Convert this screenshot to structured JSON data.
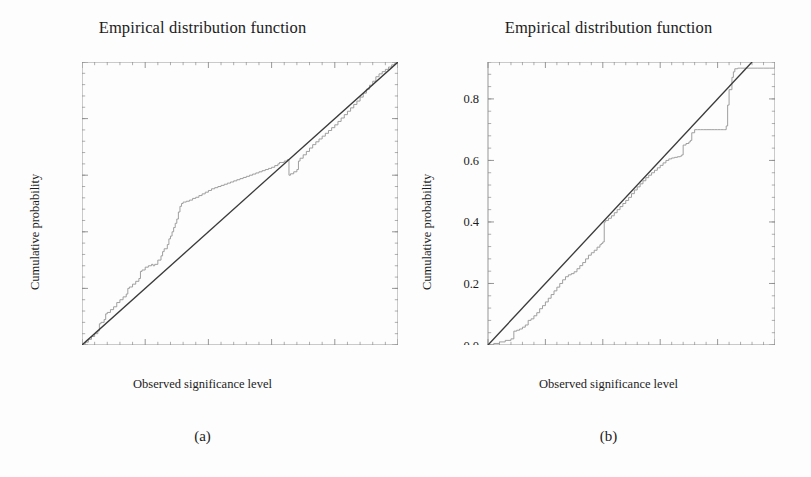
{
  "figure": {
    "caption_a": "(a)",
    "caption_b": "(b)",
    "line_color_ecdf": "#9a9a9a",
    "line_color_reference": "#3a3a3a",
    "frame_color": "#8c8c8c",
    "background": "#fdfdfd"
  },
  "panel_a": {
    "title": "Empirical distribution function",
    "xlabel": "Observed significance level",
    "ylabel": "Cumulative probability",
    "caption": "(a)",
    "xticks": [
      "0.0",
      "0.2",
      "0.4",
      "0.6",
      "0.8",
      "1.0"
    ],
    "yticks": [
      "0.0",
      "0.2",
      "0.4",
      "0.6",
      "0.8",
      "1.0"
    ]
  },
  "panel_b": {
    "title": "Empirical distribution function",
    "xlabel": "Observed significance level",
    "ylabel": "Cumulative probability",
    "caption": "(b)",
    "xticks": [
      "0.0",
      "0.2",
      "0.4",
      "0.6",
      "0.8",
      "1.0"
    ],
    "yticks": [
      "0.0",
      "0.2",
      "0.4",
      "0.6",
      "0.8"
    ]
  },
  "chart_data": [
    {
      "type": "line",
      "id": "panel-a",
      "title": "Empirical distribution function",
      "xlabel": "Observed significance level",
      "ylabel": "Cumulative probability",
      "xlim": [
        0.0,
        1.0
      ],
      "ylim": [
        0.0,
        1.0
      ],
      "xticks": [
        0.0,
        0.2,
        0.4,
        0.6,
        0.8,
        1.0
      ],
      "yticks": [
        0.0,
        0.2,
        0.4,
        0.6,
        0.8,
        1.0
      ],
      "grid": false,
      "legend": "none",
      "series": [
        {
          "name": "Empirical CDF",
          "style": "step",
          "color": "#9a9a9a",
          "x": [
            0.0,
            0.01,
            0.02,
            0.03,
            0.04,
            0.05,
            0.055,
            0.06,
            0.07,
            0.075,
            0.08,
            0.09,
            0.1,
            0.11,
            0.12,
            0.13,
            0.14,
            0.145,
            0.15,
            0.16,
            0.17,
            0.18,
            0.185,
            0.19,
            0.2,
            0.21,
            0.22,
            0.225,
            0.23,
            0.24,
            0.25,
            0.255,
            0.26,
            0.27,
            0.275,
            0.28,
            0.285,
            0.29,
            0.295,
            0.3,
            0.305,
            0.31,
            0.315,
            0.32,
            0.325,
            0.33,
            0.34,
            0.35,
            0.36,
            0.37,
            0.38,
            0.39,
            0.4,
            0.41,
            0.42,
            0.43,
            0.44,
            0.45,
            0.46,
            0.47,
            0.48,
            0.49,
            0.5,
            0.51,
            0.52,
            0.53,
            0.54,
            0.55,
            0.56,
            0.57,
            0.58,
            0.59,
            0.6,
            0.61,
            0.62,
            0.625,
            0.63,
            0.64,
            0.65,
            0.655,
            0.66,
            0.67,
            0.68,
            0.685,
            0.69,
            0.7,
            0.71,
            0.72,
            0.73,
            0.74,
            0.75,
            0.76,
            0.77,
            0.78,
            0.79,
            0.8,
            0.81,
            0.82,
            0.83,
            0.84,
            0.85,
            0.86,
            0.87,
            0.88,
            0.89,
            0.9,
            0.91,
            0.92,
            0.93,
            0.94,
            0.95,
            0.96,
            0.97,
            0.98,
            0.99,
            1.0
          ],
          "y": [
            0.0,
            0.01,
            0.02,
            0.03,
            0.04,
            0.05,
            0.075,
            0.08,
            0.09,
            0.11,
            0.115,
            0.125,
            0.135,
            0.15,
            0.16,
            0.17,
            0.18,
            0.2,
            0.205,
            0.215,
            0.225,
            0.235,
            0.26,
            0.265,
            0.275,
            0.28,
            0.285,
            0.28,
            0.285,
            0.3,
            0.315,
            0.33,
            0.34,
            0.355,
            0.375,
            0.385,
            0.4,
            0.415,
            0.43,
            0.445,
            0.47,
            0.49,
            0.5,
            0.505,
            0.505,
            0.508,
            0.512,
            0.518,
            0.522,
            0.528,
            0.534,
            0.54,
            0.546,
            0.552,
            0.556,
            0.56,
            0.564,
            0.568,
            0.572,
            0.576,
            0.58,
            0.584,
            0.588,
            0.592,
            0.596,
            0.6,
            0.604,
            0.608,
            0.612,
            0.616,
            0.62,
            0.624,
            0.628,
            0.634,
            0.64,
            0.645,
            0.645,
            0.65,
            0.655,
            0.6,
            0.605,
            0.612,
            0.62,
            0.65,
            0.66,
            0.672,
            0.684,
            0.696,
            0.708,
            0.718,
            0.728,
            0.738,
            0.748,
            0.758,
            0.768,
            0.778,
            0.79,
            0.802,
            0.814,
            0.826,
            0.838,
            0.85,
            0.862,
            0.876,
            0.89,
            0.904,
            0.918,
            0.932,
            0.948,
            0.958,
            0.966,
            0.974,
            0.982,
            0.99,
            0.996,
            1.0
          ]
        },
        {
          "name": "Reference diagonal",
          "style": "line",
          "color": "#3a3a3a",
          "x": [
            0.0,
            1.0
          ],
          "y": [
            0.0,
            1.0
          ]
        }
      ]
    },
    {
      "type": "line",
      "id": "panel-b",
      "title": "Empirical distribution function",
      "xlabel": "Observed significance level",
      "ylabel": "Cumulative probability",
      "xlim": [
        0.0,
        1.0
      ],
      "ylim": [
        0.0,
        0.92
      ],
      "xticks": [
        0.0,
        0.2,
        0.4,
        0.6,
        0.8,
        1.0
      ],
      "yticks": [
        0.0,
        0.2,
        0.4,
        0.6,
        0.8
      ],
      "grid": false,
      "legend": "none",
      "series": [
        {
          "name": "Empirical CDF",
          "style": "step",
          "color": "#9a9a9a",
          "x": [
            0.0,
            0.02,
            0.04,
            0.06,
            0.08,
            0.09,
            0.1,
            0.11,
            0.12,
            0.13,
            0.14,
            0.15,
            0.16,
            0.17,
            0.18,
            0.19,
            0.2,
            0.21,
            0.22,
            0.23,
            0.24,
            0.25,
            0.26,
            0.27,
            0.28,
            0.29,
            0.3,
            0.31,
            0.32,
            0.33,
            0.34,
            0.35,
            0.36,
            0.37,
            0.38,
            0.39,
            0.395,
            0.4,
            0.405,
            0.41,
            0.42,
            0.43,
            0.44,
            0.45,
            0.46,
            0.47,
            0.48,
            0.49,
            0.5,
            0.51,
            0.52,
            0.53,
            0.54,
            0.55,
            0.56,
            0.57,
            0.58,
            0.59,
            0.6,
            0.61,
            0.62,
            0.63,
            0.64,
            0.65,
            0.66,
            0.67,
            0.675,
            0.68,
            0.69,
            0.7,
            0.705,
            0.71,
            0.72,
            0.73,
            0.74,
            0.75,
            0.76,
            0.77,
            0.78,
            0.79,
            0.8,
            0.81,
            0.82,
            0.825,
            0.83,
            0.835,
            0.84,
            0.85,
            0.855,
            0.86,
            0.87,
            0.88,
            0.9,
            0.92,
            0.94,
            0.96,
            0.98,
            1.0
          ],
          "y": [
            0.0,
            0.005,
            0.01,
            0.015,
            0.02,
            0.045,
            0.048,
            0.052,
            0.058,
            0.065,
            0.08,
            0.085,
            0.095,
            0.105,
            0.118,
            0.128,
            0.14,
            0.152,
            0.164,
            0.176,
            0.188,
            0.2,
            0.212,
            0.222,
            0.228,
            0.232,
            0.238,
            0.248,
            0.258,
            0.268,
            0.28,
            0.292,
            0.3,
            0.308,
            0.318,
            0.326,
            0.33,
            0.335,
            0.4,
            0.405,
            0.412,
            0.42,
            0.43,
            0.44,
            0.45,
            0.46,
            0.47,
            0.48,
            0.492,
            0.504,
            0.514,
            0.524,
            0.534,
            0.544,
            0.552,
            0.56,
            0.568,
            0.576,
            0.584,
            0.592,
            0.6,
            0.605,
            0.608,
            0.61,
            0.612,
            0.614,
            0.618,
            0.65,
            0.655,
            0.66,
            0.665,
            0.69,
            0.7,
            0.7,
            0.7,
            0.7,
            0.7,
            0.7,
            0.7,
            0.7,
            0.7,
            0.7,
            0.7,
            0.7,
            0.712,
            0.78,
            0.83,
            0.87,
            0.888,
            0.898,
            0.9,
            0.9,
            0.9,
            0.9,
            0.9,
            0.9,
            0.9,
            0.9,
            0.9
          ]
        },
        {
          "name": "Reference diagonal",
          "style": "line",
          "color": "#3a3a3a",
          "x": [
            0.0,
            0.92
          ],
          "y": [
            0.0,
            0.92
          ]
        }
      ]
    }
  ]
}
